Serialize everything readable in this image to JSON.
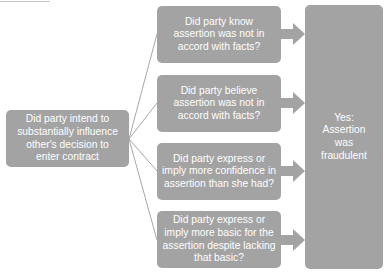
{
  "diagram": {
    "start": {
      "lines": [
        "Did party intend to",
        "substantially influence",
        "other's decision to",
        "enter contract"
      ]
    },
    "questions": [
      {
        "lines": [
          "Did party know",
          "assertion was not in",
          "accord with facts?"
        ]
      },
      {
        "lines": [
          "Did party believe",
          "assertion was not in",
          "accord with facts?"
        ]
      },
      {
        "lines": [
          "Did party express or",
          "imply more confidence in",
          "assertion than she had?"
        ]
      },
      {
        "lines": [
          "Did party express or",
          "imply more basic for the",
          "assertion despite lacking",
          "that basic?"
        ]
      }
    ],
    "result": {
      "lines": [
        "Yes:",
        "Assertion",
        "was",
        "fraudulent"
      ]
    },
    "colors": {
      "box_fill": "#a3a3a3",
      "connector": "#a8a8a8",
      "text": "#ffffff"
    }
  }
}
